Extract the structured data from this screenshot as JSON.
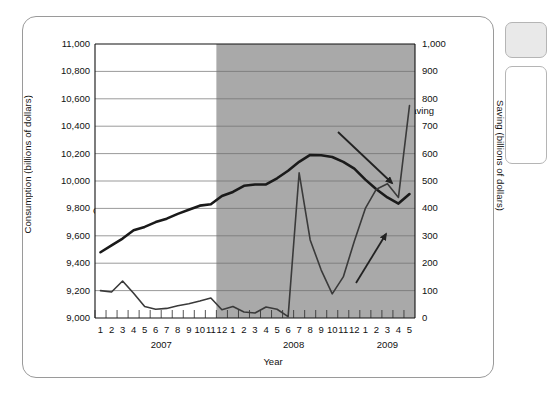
{
  "chart_data": {
    "type": "line",
    "title": "",
    "xlabel": "Year",
    "ylabel": "Consumption (billions of dollars)",
    "ylabel_right": "Saving (billions of dollars)",
    "ylim": [
      9000,
      11000
    ],
    "ylim_right": [
      0,
      1000
    ],
    "yticks": [
      "9,000",
      "9,200",
      "9,400",
      "9,600",
      "9,800",
      "10,000",
      "10,200",
      "10,400",
      "10,600",
      "10,800",
      "11,000"
    ],
    "yticks_right": [
      "0",
      "100",
      "200",
      "300",
      "400",
      "500",
      "600",
      "700",
      "800",
      "900",
      "1,000"
    ],
    "grid": true,
    "legend": "inline-annotations",
    "x": [
      "1",
      "2",
      "3",
      "4",
      "5",
      "6",
      "7",
      "8",
      "9",
      "10",
      "11",
      "12",
      "1",
      "2",
      "3",
      "4",
      "5",
      "6",
      "7",
      "8",
      "9",
      "10",
      "11",
      "12",
      "1",
      "2",
      "3",
      "4",
      "5"
    ],
    "year_groups": [
      {
        "label": "2007",
        "start_index": 0,
        "end_index": 11
      },
      {
        "label": "2008",
        "start_index": 12,
        "end_index": 23
      },
      {
        "label": "2009",
        "start_index": 24,
        "end_index": 28
      }
    ],
    "shaded_region": {
      "label": "recession",
      "start_index": 11,
      "end_index": 28,
      "color": "#a9a9a9"
    },
    "series": [
      {
        "name": "Consumption",
        "axis": "left",
        "color": "#1a1a1a",
        "width": 2.6,
        "values": [
          9480,
          9530,
          9580,
          9640,
          9665,
          9700,
          9725,
          9760,
          9790,
          9820,
          9830,
          9890,
          9920,
          9965,
          9975,
          9975,
          10020,
          10075,
          10140,
          10190,
          10188,
          10175,
          10140,
          10090,
          10010,
          9940,
          9880,
          9835,
          9905
        ]
      },
      {
        "name": "Saving",
        "axis": "right",
        "color": "#3a3a3a",
        "width": 1.6,
        "values": [
          100,
          95,
          135,
          90,
          42,
          32,
          35,
          45,
          52,
          62,
          73,
          30,
          42,
          22,
          18,
          40,
          32,
          5,
          530,
          285,
          175,
          88,
          150,
          280,
          400,
          470,
          490,
          440,
          470
        ]
      }
    ],
    "extra_saving_endpoint": 775,
    "annotations": [
      {
        "name": "consumption-label",
        "text": "Consumption",
        "x_px": 93,
        "y_px": 205
      },
      {
        "name": "saving-label",
        "text": "Saving",
        "x_px": 405,
        "y_px": 105
      },
      {
        "name": "down-arrow",
        "type": "arrow",
        "x1": 338,
        "y1": 132,
        "x2": 392,
        "y2": 183
      },
      {
        "name": "up-arrow",
        "type": "arrow",
        "x1": 356,
        "y1": 283,
        "x2": 386,
        "y2": 234
      }
    ],
    "colors": {
      "shade": "#a9a9a9",
      "grid": "#6f6f6f",
      "axis": "#111111",
      "consumption": "#1a1a1a",
      "saving": "#3a3a3a",
      "frame": "#9a9a9a"
    }
  }
}
